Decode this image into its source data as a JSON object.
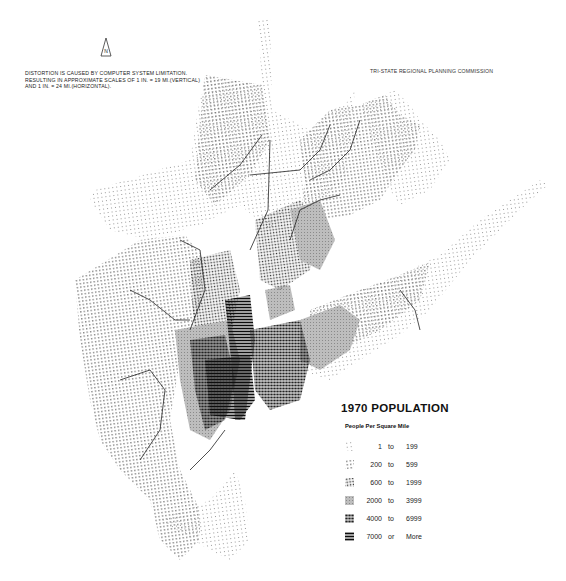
{
  "header": {
    "note_lines": [
      "DISTORTION IS CAUSED BY COMPUTER SYSTEM LIMITATION.",
      "RESULTING IN APPROXIMATE  SCALES OF 1 IN. = 19 MI.(VERTICAL)",
      "AND 1 IN. = 24 MI.(HORIZONTAL)."
    ],
    "agency": "TRI-STATE REGIONAL PLANNING COMMISSION",
    "north_arrow_label": "N"
  },
  "legend": {
    "title": "1970  POPULATION",
    "subtitle": "People Per Square Mile",
    "classes": [
      {
        "low": "1",
        "joiner": "to",
        "high": "199",
        "color": "#c8c8c8",
        "pattern": "sparse-light-dots"
      },
      {
        "low": "200",
        "joiner": "to",
        "high": "599",
        "color": "#8a8a8a",
        "pattern": "sparse-dots"
      },
      {
        "low": "600",
        "joiner": "to",
        "high": "1999",
        "color": "#555555",
        "pattern": "medium-dots"
      },
      {
        "low": "2000",
        "joiner": "to",
        "high": "3999",
        "color": "#9a9a9a",
        "pattern": "gray-hatched"
      },
      {
        "low": "4000",
        "joiner": "to",
        "high": "6999",
        "color": "#333333",
        "pattern": "dense-dots"
      },
      {
        "low": "7000",
        "joiner": "or",
        "high": "More",
        "color": "#111111",
        "pattern": "solid-bars"
      }
    ]
  },
  "map": {
    "region": "New York Tri-State Region",
    "theme": "1970 population density, dot-matrix computer map"
  }
}
